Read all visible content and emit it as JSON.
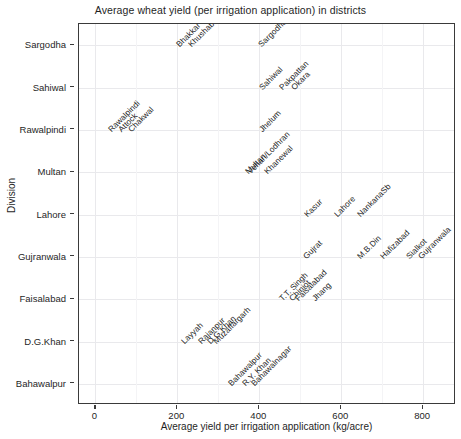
{
  "chart_data": {
    "type": "scatter",
    "title": "Average wheat yield (per irrigation application) in districts",
    "xlabel": "Average yield per irrigation application (kg/acre)",
    "ylabel": "Division",
    "xlim": [
      -40,
      880
    ],
    "xticks": [
      0,
      200,
      400,
      600,
      800
    ],
    "xtick_labels": [
      "0",
      "200",
      "400",
      "600",
      "800"
    ],
    "yticks": [
      "Bahawalpur",
      "D.G.Khan",
      "Faisalabad",
      "Gujranwala",
      "Lahore",
      "Multan",
      "Rawalpindi",
      "Sahiwal",
      "Sargodha"
    ],
    "grid": "major-x, minor-x, major-y",
    "legend": "none",
    "label_rotation_deg": 45,
    "points": [
      {
        "label": "Bhakkar",
        "x": 210,
        "y": "Sargodha"
      },
      {
        "label": "Khushab",
        "x": 238,
        "y": "Sargodha"
      },
      {
        "label": "Sargodha",
        "x": 410,
        "y": "Sargodha"
      },
      {
        "label": "Sahiwal",
        "x": 412,
        "y": "Sahiwal"
      },
      {
        "label": "Pakpattan",
        "x": 460,
        "y": "Sahiwal"
      },
      {
        "label": "Okara",
        "x": 490,
        "y": "Sahiwal"
      },
      {
        "label": "Rawalpindi",
        "x": 42,
        "y": "Rawalpindi"
      },
      {
        "label": "Attock",
        "x": 68,
        "y": "Rawalpindi"
      },
      {
        "label": "Chakwal",
        "x": 92,
        "y": "Rawalpindi"
      },
      {
        "label": "Jhelum",
        "x": 412,
        "y": "Rawalpindi"
      },
      {
        "label": "Multan",
        "x": 378,
        "y": "Multan"
      },
      {
        "label": "Vehari/Lodhran",
        "x": 382,
        "y": "Multan"
      },
      {
        "label": "Khanewal",
        "x": 424,
        "y": "Multan"
      },
      {
        "label": "Kasur",
        "x": 522,
        "y": "Lahore"
      },
      {
        "label": "Lahore",
        "x": 594,
        "y": "Lahore"
      },
      {
        "label": "NankanaSb",
        "x": 650,
        "y": "Lahore"
      },
      {
        "label": "Gujrat",
        "x": 518,
        "y": "Gujranwala"
      },
      {
        "label": "M.B.Din",
        "x": 650,
        "y": "Gujranwala"
      },
      {
        "label": "Hafizabad",
        "x": 706,
        "y": "Gujranwala"
      },
      {
        "label": "Sialkot",
        "x": 770,
        "y": "Gujranwala"
      },
      {
        "label": "Gujranwala",
        "x": 800,
        "y": "Gujranwala"
      },
      {
        "label": "T.T. Singh",
        "x": 460,
        "y": "Faisalabad"
      },
      {
        "label": "Chiniot",
        "x": 484,
        "y": "Faisalabad"
      },
      {
        "label": "Faisalabad",
        "x": 498,
        "y": "Faisalabad"
      },
      {
        "label": "Jhang",
        "x": 540,
        "y": "Faisalabad"
      },
      {
        "label": "Layyah",
        "x": 222,
        "y": "D.G.Khan"
      },
      {
        "label": "Rajanpur",
        "x": 262,
        "y": "D.G.Khan"
      },
      {
        "label": "D.G.Khan",
        "x": 284,
        "y": "D.G.Khan"
      },
      {
        "label": "Muzaffargarh",
        "x": 300,
        "y": "D.G.Khan"
      },
      {
        "label": "Bahawalpur",
        "x": 336,
        "y": "Bahawalpur"
      },
      {
        "label": "R.Y. Khan",
        "x": 370,
        "y": "Bahawalpur"
      },
      {
        "label": "Bahawalnagar",
        "x": 392,
        "y": "Bahawalpur"
      }
    ]
  }
}
